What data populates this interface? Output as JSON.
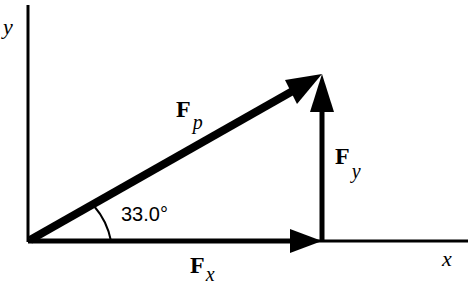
{
  "diagram": {
    "type": "vector-decomposition",
    "axes": {
      "x_label": "x",
      "y_label": "y"
    },
    "vectors": [
      {
        "name": "Fp",
        "main": "F",
        "subscript": "p",
        "from": [
          0,
          0
        ],
        "direction": "33.0° above x-axis"
      },
      {
        "name": "Fx",
        "main": "F",
        "subscript": "x",
        "direction": "along +x"
      },
      {
        "name": "Fy",
        "main": "F",
        "subscript": "y",
        "direction": "along +y"
      }
    ],
    "angle_label": "33.0°",
    "colors": {
      "line": "#000000",
      "background": "#ffffff"
    }
  }
}
